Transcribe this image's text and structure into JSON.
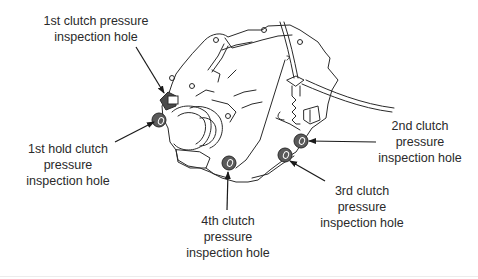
{
  "diagram": {
    "callouts": [
      {
        "id": "1st-clutch",
        "lines": [
          "1st clutch pressure",
          "inspection hole"
        ]
      },
      {
        "id": "1st-hold-clutch",
        "lines": [
          "1st hold clutch",
          "pressure",
          "inspection hole"
        ]
      },
      {
        "id": "4th-clutch",
        "lines": [
          "4th clutch",
          "pressure",
          "inspection hole"
        ]
      },
      {
        "id": "3rd-clutch",
        "lines": [
          "3rd clutch",
          "pressure",
          "inspection hole"
        ]
      },
      {
        "id": "2nd-clutch",
        "lines": [
          "2nd clutch",
          "pressure",
          "inspection hole"
        ]
      }
    ],
    "colors": {
      "line": "#2a2a2a",
      "hole_fill": "#5a5a5a",
      "background": "#ffffff"
    }
  }
}
